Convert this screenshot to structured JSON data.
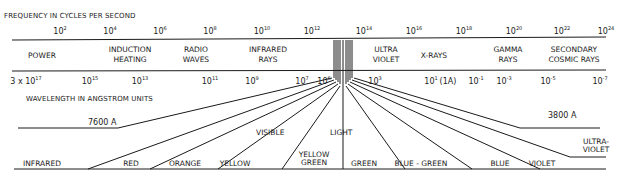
{
  "frequency_axis": {
    "title": "FREQUENCY IN CYCLES PER SECOND",
    "ticks": [
      {
        "base": "10",
        "exp": "2",
        "x": 60
      },
      {
        "base": "10",
        "exp": "4",
        "x": 110
      },
      {
        "base": "10",
        "exp": "6",
        "x": 160
      },
      {
        "base": "10",
        "exp": "8",
        "x": 210
      },
      {
        "base": "10",
        "exp": "10",
        "x": 262
      },
      {
        "base": "10",
        "exp": "12",
        "x": 312
      },
      {
        "base": "10",
        "exp": "14",
        "x": 364
      },
      {
        "base": "10",
        "exp": "16",
        "x": 414
      },
      {
        "base": "10",
        "exp": "18",
        "x": 464
      },
      {
        "base": "10",
        "exp": "20",
        "x": 514
      },
      {
        "base": "10",
        "exp": "22",
        "x": 562
      },
      {
        "base": "10",
        "exp": "24",
        "x": 606
      }
    ]
  },
  "bands": [
    {
      "line1": "POWER",
      "line2": "",
      "x": 42
    },
    {
      "line1": "INDUCTION",
      "line2": "HEATING",
      "x": 130
    },
    {
      "line1": "RADIO",
      "line2": "WAVES",
      "x": 196
    },
    {
      "line1": "INFRARED",
      "line2": "RAYS",
      "x": 268
    },
    {
      "line1": "ULTRA",
      "line2": "VIOLET",
      "x": 386
    },
    {
      "line1": "X-RAYS",
      "line2": "",
      "x": 434
    },
    {
      "line1": "GAMMA",
      "line2": "RAYS",
      "x": 508
    },
    {
      "line1": "SECONDARY",
      "line2": "COSMIC RAYS",
      "x": 574
    }
  ],
  "wavelength_axis": {
    "title": "WAVELENGTH IN ANGSTROM UNITS",
    "ticks": [
      {
        "prefix": "3 x ",
        "base": "10",
        "exp": "17",
        "x": 26
      },
      {
        "prefix": "",
        "base": "10",
        "exp": "15",
        "x": 90
      },
      {
        "prefix": "",
        "base": "10",
        "exp": "13",
        "x": 140
      },
      {
        "prefix": "",
        "base": "10",
        "exp": "11",
        "x": 210
      },
      {
        "prefix": "",
        "base": "10",
        "exp": "9",
        "x": 252
      },
      {
        "prefix": "",
        "base": "10",
        "exp": "7",
        "x": 302
      },
      {
        "prefix": "",
        "base": "10",
        "exp": "6",
        "x": 324
      },
      {
        "prefix": "",
        "base": "10",
        "exp": "3",
        "x": 375
      },
      {
        "prefix": "",
        "base": "10",
        "exp": "1",
        "x": 431
      },
      {
        "prefix": "",
        "base": "(1A)",
        "exp": "",
        "x": 448
      },
      {
        "prefix": "",
        "base": "10",
        "exp": "-1",
        "x": 476
      },
      {
        "prefix": "",
        "base": "10",
        "exp": "-3",
        "x": 504
      },
      {
        "prefix": "",
        "base": "10",
        "exp": "-5",
        "x": 548
      },
      {
        "prefix": "",
        "base": "10",
        "exp": "-7",
        "x": 600
      }
    ]
  },
  "visible_light": {
    "label_left": "VISIBLE",
    "label_right": "LIGHT",
    "limit_long": "7600 A",
    "limit_short": "3800 A",
    "colors": [
      {
        "name": "INFRARED",
        "x": 42
      },
      {
        "name": "RED",
        "x": 131
      },
      {
        "name": "ORANGE",
        "x": 185
      },
      {
        "name": "YELLOW",
        "x": 235
      },
      {
        "name": "YELLOW",
        "name2": "GREEN",
        "x": 314
      },
      {
        "name": "GREEN",
        "x": 364
      },
      {
        "name": "BLUE - GREEN",
        "x": 421
      },
      {
        "name": "BLUE",
        "x": 500
      },
      {
        "name": "VIOLET",
        "x": 542
      },
      {
        "name": "ULTRA-",
        "name2": "VIOLET",
        "x": 596
      }
    ]
  }
}
